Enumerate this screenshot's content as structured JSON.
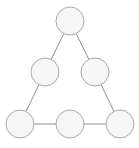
{
  "figure": {
    "width": 139,
    "height": 148,
    "background_color": "#ffffff"
  },
  "style": {
    "node_fill": "#f7f7f7",
    "node_stroke": "#a8a8a8",
    "node_stroke_width": 1,
    "node_radius": 14,
    "edge_stroke": "#8f8f8f",
    "edge_stroke_width": 1
  },
  "chart_data": {
    "type": "diagram",
    "diagram_kind": "undirected-graph",
    "title": "",
    "node_count": 6,
    "edge_count": 6,
    "nodes": [
      {
        "id": "apex",
        "label": "",
        "x": 70,
        "y": 21,
        "r": 14
      },
      {
        "id": "mid-left",
        "label": "",
        "x": 45,
        "y": 72,
        "r": 14
      },
      {
        "id": "mid-right",
        "label": "",
        "x": 95,
        "y": 72,
        "r": 14
      },
      {
        "id": "base-left",
        "label": "",
        "x": 20,
        "y": 124,
        "r": 14
      },
      {
        "id": "base-center",
        "label": "",
        "x": 70,
        "y": 124,
        "r": 14
      },
      {
        "id": "base-right",
        "label": "",
        "x": 120,
        "y": 124,
        "r": 14
      }
    ],
    "edges": [
      {
        "from": "apex",
        "to": "mid-left"
      },
      {
        "from": "apex",
        "to": "mid-right"
      },
      {
        "from": "mid-left",
        "to": "base-left"
      },
      {
        "from": "mid-right",
        "to": "base-right"
      },
      {
        "from": "base-left",
        "to": "base-center"
      },
      {
        "from": "base-center",
        "to": "base-right"
      }
    ],
    "layout_hints": {
      "shape": "equilateral triangle outline",
      "rows": [
        1,
        2,
        3
      ],
      "grid": false,
      "legend": "none",
      "axes": "none"
    }
  }
}
